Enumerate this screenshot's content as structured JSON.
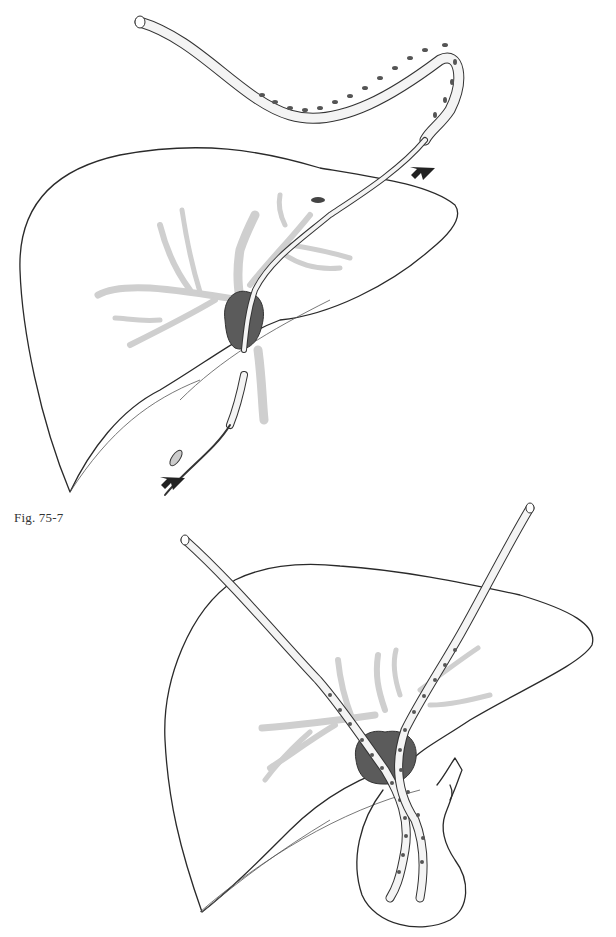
{
  "document": {
    "type": "medical illustration",
    "caption": "Fig. 75-7",
    "figures": [
      {
        "id": "top",
        "description": "Liver with biliary tree; perforated transhepatic stent pulled through hilar tumor by guide catheter",
        "arrows": [
          "down-left near stent entry",
          "down-left near distal guide"
        ]
      },
      {
        "id": "bottom",
        "description": "Liver with two perforated transhepatic stents crossing hilar tumor into jejunal (Roux) limb"
      }
    ]
  },
  "colors": {
    "background": "#ffffff",
    "line": "#2a2a2a",
    "duct_shade": "#cfcfcf",
    "tumor": "#5b5b5b",
    "caption_text": "#333333"
  }
}
